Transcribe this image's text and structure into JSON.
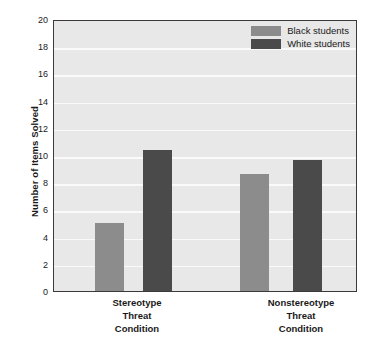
{
  "chart_data": {
    "type": "bar",
    "title": "",
    "xlabel": "",
    "ylabel": "Number of Items Solved",
    "ylim": [
      0,
      20
    ],
    "yticks": [
      0,
      2,
      4,
      6,
      8,
      10,
      12,
      14,
      16,
      18,
      20
    ],
    "ytick_labels": [
      "0",
      "2",
      "4",
      "6",
      "8",
      "10",
      "12",
      "14",
      "16",
      "18",
      "20"
    ],
    "grid": true,
    "grid_axis": "y",
    "legend_position": "top-right",
    "categories": [
      "Stereotype Threat Condition",
      "Nonstereotype Threat Condition"
    ],
    "category_lines": [
      [
        "Stereotype",
        "Threat",
        "Condition"
      ],
      [
        "Nonstereotype",
        "Threat",
        "Condition"
      ]
    ],
    "series": [
      {
        "name": "Black students",
        "color": "#8c8c8c",
        "values": [
          5.0,
          8.6
        ]
      },
      {
        "name": "White students",
        "color": "#4a4a4a",
        "values": [
          10.4,
          9.6
        ]
      }
    ],
    "bars": [
      {
        "label": "Black students",
        "category": "Stereotype Threat Condition",
        "value": 5.0,
        "color": "#8c8c8c"
      },
      {
        "label": "White students",
        "category": "Stereotype Threat Condition",
        "value": 10.4,
        "color": "#4a4a4a"
      },
      {
        "label": "Black students",
        "category": "Nonstereotype Threat Condition",
        "value": 8.6,
        "color": "#8c8c8c"
      },
      {
        "label": "White students",
        "category": "Nonstereotype Threat Condition",
        "value": 9.6,
        "color": "#4a4a4a"
      }
    ]
  },
  "style": {
    "plot_background": "#e8e8e8",
    "gridline_color": "#fafafa",
    "frame_color": "#3a3a3a",
    "page_background": "#ffffff",
    "text_color": "#1a1a1a"
  }
}
